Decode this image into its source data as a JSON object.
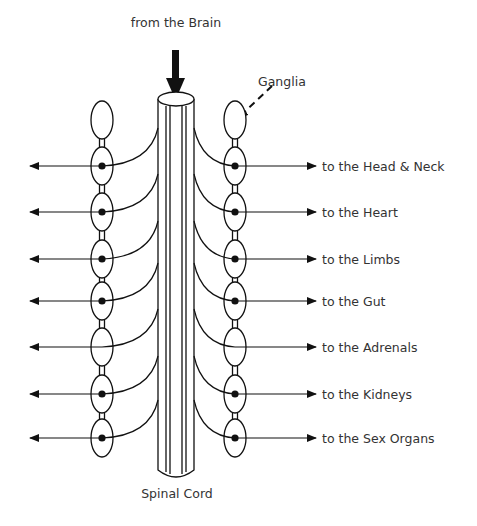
{
  "title_label": "from the Brain",
  "ganglia_label": "Ganglia",
  "cord_label": "Spinal Cord",
  "colors": {
    "stroke": "#111111",
    "text": "#333333",
    "background": "#ffffff"
  },
  "rows": [
    {
      "y": 166,
      "label": "to the Head & Neck",
      "left_dot": true,
      "right_dot": true
    },
    {
      "y": 212,
      "label": "to the Heart",
      "left_dot": true,
      "right_dot": true
    },
    {
      "y": 259,
      "label": "to the Limbs",
      "left_dot": true,
      "right_dot": true
    },
    {
      "y": 301,
      "label": "to the Gut",
      "left_dot": true,
      "right_dot": true
    },
    {
      "y": 347,
      "label": "to the Adrenals",
      "left_dot": false,
      "right_dot": false
    },
    {
      "y": 394,
      "label": "to the Kidneys",
      "left_dot": true,
      "right_dot": true
    },
    {
      "y": 438,
      "label": "to the Sex Organs",
      "left_dot": true,
      "right_dot": true
    }
  ]
}
